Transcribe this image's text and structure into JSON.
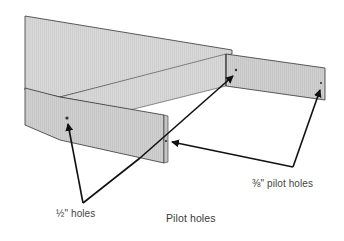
{
  "diagram": {
    "caption": "Pilot holes",
    "labels": {
      "half_inch_holes": "½\" holes",
      "three_eighths_pilot_holes": "⅜\" pilot holes"
    },
    "colors": {
      "board_top": "#dcdcdc",
      "board_face": "#d2d2d2",
      "board_end": "#c4c4c4",
      "edge": "#333333",
      "arrow": "#111111",
      "text": "#444444"
    }
  }
}
